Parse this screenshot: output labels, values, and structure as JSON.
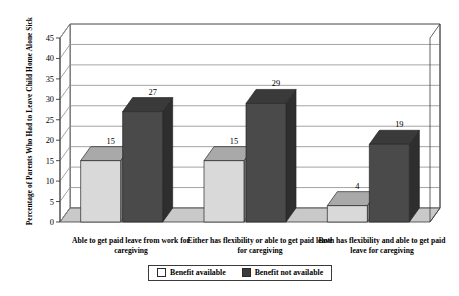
{
  "chart_data": {
    "type": "bar",
    "title": "",
    "xlabel": "",
    "ylabel": "Percentage of Parents Who Had to Leave Child Home Alone Sick",
    "ylim": [
      0,
      45
    ],
    "ytick_step": 5,
    "yticks": [
      "0",
      "5",
      "10",
      "15",
      "20",
      "25",
      "30",
      "35",
      "40",
      "45"
    ],
    "grid": true,
    "legend_position": "bottom",
    "style": "3d-clustered-column",
    "categories": [
      "Able to get paid leave from work for caregiving",
      "Either has flexibility or able to get paid leave for caregiving",
      "Both has flexibility and able to get paid leave for caregiving"
    ],
    "series": [
      {
        "name": "Benefit available",
        "values": [
          15,
          15,
          4
        ],
        "color": "#d9d9d9"
      },
      {
        "name": "Benefit not available",
        "values": [
          27,
          29,
          19
        ],
        "color": "#4a4a4a"
      }
    ]
  },
  "legend": {
    "items": [
      {
        "label": "Benefit available"
      },
      {
        "label": "Benefit not available"
      }
    ]
  }
}
